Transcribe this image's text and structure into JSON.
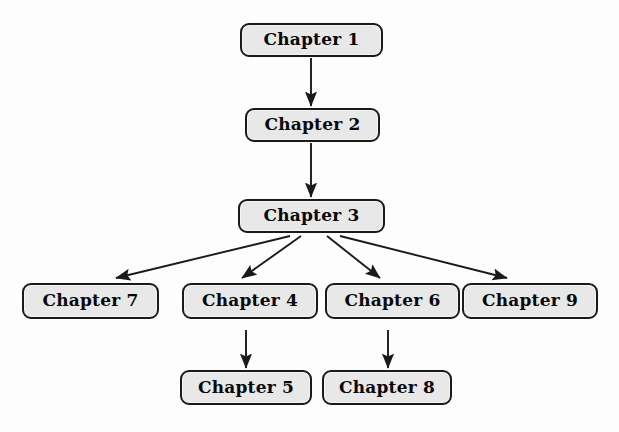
{
  "diagram": {
    "background_color": "#fdfdfd",
    "node_fill_color": "#e8e8e8",
    "node_border_color": "#1a1a1a",
    "edge_color": "#1a1a1a",
    "nodes": [
      {
        "id": "ch1",
        "label": "Chapter 1",
        "x": 240,
        "y": 23,
        "w": 143,
        "h": 34
      },
      {
        "id": "ch2",
        "label": "Chapter 2",
        "x": 245,
        "y": 108,
        "w": 135,
        "h": 34
      },
      {
        "id": "ch3",
        "label": "Chapter 3",
        "x": 238,
        "y": 199,
        "w": 147,
        "h": 34
      },
      {
        "id": "ch7",
        "label": "Chapter 7",
        "x": 22,
        "y": 283,
        "w": 137,
        "h": 36
      },
      {
        "id": "ch4",
        "label": "Chapter 4",
        "x": 182,
        "y": 283,
        "w": 136,
        "h": 36
      },
      {
        "id": "ch6",
        "label": "Chapter 6",
        "x": 325,
        "y": 283,
        "w": 135,
        "h": 36
      },
      {
        "id": "ch9",
        "label": "Chapter 9",
        "x": 462,
        "y": 283,
        "w": 136,
        "h": 36
      },
      {
        "id": "ch5",
        "label": "Chapter 5",
        "x": 180,
        "y": 370,
        "w": 132,
        "h": 35
      },
      {
        "id": "ch8",
        "label": "Chapter 8",
        "x": 322,
        "y": 370,
        "w": 130,
        "h": 35
      }
    ],
    "edges": [
      {
        "id": "e1",
        "from": "ch1",
        "to": "ch2",
        "x1": 311,
        "y1": 58,
        "x2": 311,
        "y2": 106
      },
      {
        "id": "e2",
        "from": "ch2",
        "to": "ch3",
        "x1": 311,
        "y1": 143,
        "x2": 311,
        "y2": 197
      },
      {
        "id": "e3",
        "from": "ch3",
        "to": "ch7",
        "x1": 290,
        "y1": 236,
        "x2": 116,
        "y2": 278
      },
      {
        "id": "e4",
        "from": "ch3",
        "to": "ch4",
        "x1": 301,
        "y1": 236,
        "x2": 242,
        "y2": 278
      },
      {
        "id": "e5",
        "from": "ch3",
        "to": "ch6",
        "x1": 327,
        "y1": 236,
        "x2": 380,
        "y2": 278
      },
      {
        "id": "e6",
        "from": "ch3",
        "to": "ch9",
        "x1": 340,
        "y1": 236,
        "x2": 507,
        "y2": 278
      },
      {
        "id": "e7",
        "from": "ch4",
        "to": "ch5",
        "x1": 246,
        "y1": 330,
        "x2": 246,
        "y2": 368
      },
      {
        "id": "e8",
        "from": "ch6",
        "to": "ch8",
        "x1": 388,
        "y1": 330,
        "x2": 388,
        "y2": 368
      }
    ]
  }
}
